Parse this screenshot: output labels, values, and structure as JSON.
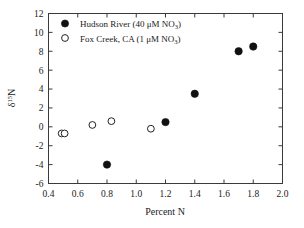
{
  "chart_data": {
    "type": "scatter",
    "title": "",
    "xlabel": "Percent N",
    "ylabel": "δ¹⁵N",
    "ylabel_parts": {
      "delta": "δ",
      "sup": "15",
      "element": "N"
    },
    "xlim": [
      0.4,
      2.0
    ],
    "ylim": [
      -6,
      12
    ],
    "xticks": [
      "0.4",
      "0.6",
      "0.8",
      "1.0",
      "1.2",
      "1.4",
      "1.6",
      "1.8",
      "2.0"
    ],
    "xtick_values": [
      0.4,
      0.6,
      0.8,
      1.0,
      1.2,
      1.4,
      1.6,
      1.8,
      2.0
    ],
    "yticks": [
      "12",
      "10",
      "8",
      "6",
      "4",
      "2",
      "0",
      "-2",
      "-4",
      "-6"
    ],
    "ytick_values": [
      12,
      10,
      8,
      6,
      4,
      2,
      0,
      -2,
      -4,
      -6
    ],
    "grid": false,
    "legend_position": "top-left",
    "series": [
      {
        "name": "Hudson River (40 μM NO₃)",
        "label_main": "Hudson River (40 μM NO",
        "label_sub": "3",
        "label_tail": ")",
        "marker": "filled-circle",
        "color": "#111111",
        "points": [
          {
            "x": 0.8,
            "y": -4.0
          },
          {
            "x": 1.2,
            "y": 0.5
          },
          {
            "x": 1.4,
            "y": 3.5
          },
          {
            "x": 1.7,
            "y": 8.0
          },
          {
            "x": 1.8,
            "y": 8.5
          }
        ]
      },
      {
        "name": "Fox Creek, CA (1 μM NO₃)",
        "label_main": "Fox Creek, CA (1 μM NO",
        "label_sub": "3",
        "label_tail": ")",
        "marker": "open-circle",
        "color": "#ffffff",
        "points": [
          {
            "x": 0.49,
            "y": -0.7
          },
          {
            "x": 0.51,
            "y": -0.7
          },
          {
            "x": 0.7,
            "y": 0.2
          },
          {
            "x": 0.83,
            "y": 0.6
          },
          {
            "x": 1.1,
            "y": -0.2
          }
        ]
      }
    ]
  },
  "legend": {
    "entries": [
      {
        "marker": "filled-circle",
        "text": "Hudson River (40 μM NO3)"
      },
      {
        "marker": "open-circle",
        "text": "Fox Creek, CA (1 μM NO3)"
      }
    ]
  }
}
